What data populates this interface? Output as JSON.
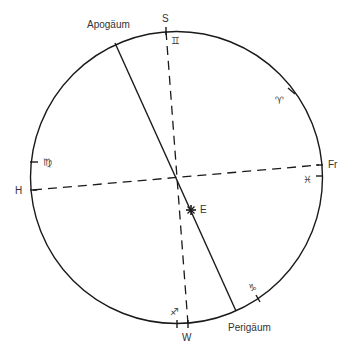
{
  "diagram": {
    "title": "",
    "colors": {
      "stroke": "#1a1a1a",
      "text": "#333333",
      "background": "#ffffff"
    },
    "circle": {
      "cx": 176.5,
      "cy": 177.5,
      "r": 146
    },
    "labels": {
      "apogee": "Apogäum",
      "perigee": "Perigäum",
      "south": "S",
      "west": "W",
      "h": "H",
      "fr": "Fr",
      "earth": "E"
    },
    "zodiac": {
      "gemini": "♊",
      "aries": "♈",
      "virgo": "♍",
      "pisces": "♓",
      "capricorn": "♑",
      "sagittarius": "♐"
    },
    "lines": {
      "apsides": {
        "style": "solid",
        "from": "Apogäum",
        "to": "Perigäum"
      },
      "south_west": {
        "style": "dashed",
        "from": "S",
        "to": "W"
      },
      "h_fr": {
        "style": "dashed",
        "from": "H",
        "to": "Fr"
      }
    },
    "markers": {
      "earth": {
        "symbol": "star",
        "label": "E"
      }
    }
  }
}
